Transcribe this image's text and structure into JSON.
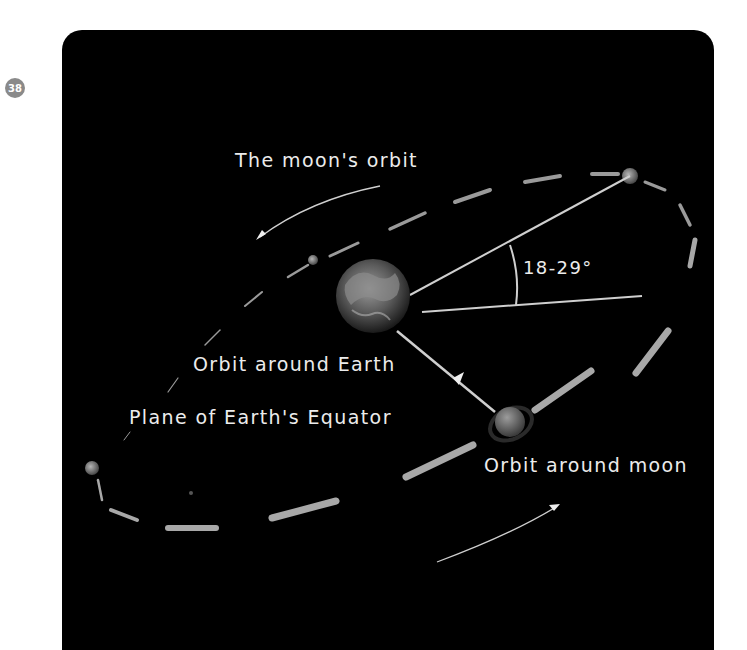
{
  "page": {
    "number": "38"
  },
  "diagram": {
    "title": "The moon's orbit",
    "angle_label": "18-29°",
    "labels": {
      "orbit_earth": "Orbit around Earth",
      "equator_plane": "Plane of Earth's Equator",
      "orbit_moon": "Orbit around moon"
    },
    "icons": [
      "earth-icon",
      "moon-icon",
      "orbit-marker-icon",
      "arrow-icon"
    ],
    "colors": {
      "background": "#000000",
      "text": "#ececec",
      "orbit_dash": "#a8a8a8",
      "badge": "#8a8a8a"
    }
  }
}
